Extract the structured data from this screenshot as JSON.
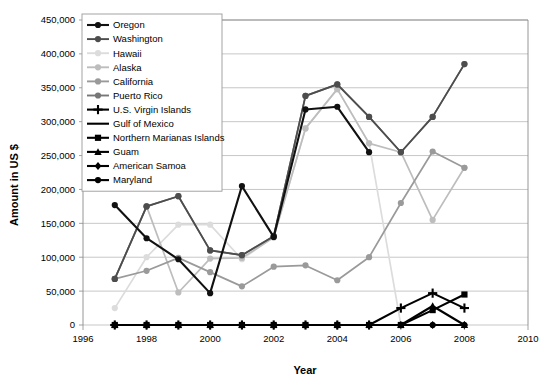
{
  "chart_data": {
    "type": "line",
    "title": "",
    "xlabel": "Year",
    "ylabel": "Amount in US $",
    "xlim": [
      1996,
      2010
    ],
    "ylim": [
      0,
      450000
    ],
    "xticks": [
      "1996",
      "1998",
      "2000",
      "2002",
      "2004",
      "2006",
      "2008",
      "2010"
    ],
    "yticks": [
      "0",
      "50,000",
      "100,000",
      "150,000",
      "200,000",
      "250,000",
      "300,000",
      "350,000",
      "400,000",
      "450,000"
    ],
    "grid": true,
    "legend_position": "top-left",
    "x": [
      1997,
      1998,
      1999,
      2000,
      2001,
      2002,
      2003,
      2004,
      2005,
      2006,
      2007,
      2008
    ],
    "series": [
      {
        "name": "Oregon",
        "color": "#111111",
        "marker": "circle",
        "values": [
          177000,
          128000,
          97000,
          47000,
          205000,
          130000,
          318000,
          322000,
          255000,
          null,
          null,
          null
        ]
      },
      {
        "name": "Washington",
        "color": "#4d4d4d",
        "marker": "circle",
        "values": [
          68000,
          175000,
          190000,
          110000,
          103000,
          131000,
          338000,
          355000,
          307000,
          255000,
          307000,
          385000
        ]
      },
      {
        "name": "Hawaii",
        "color": "#dcdcdc",
        "marker": "circle",
        "values": [
          25000,
          100000,
          148000,
          148000,
          97000,
          130000,
          290000,
          348000,
          268000,
          0,
          null,
          null
        ]
      },
      {
        "name": "Alaska",
        "color": "#bdbdbd",
        "marker": "circle",
        "values": [
          68000,
          175000,
          48000,
          98000,
          99000,
          129000,
          290000,
          348000,
          268000,
          255000,
          155000,
          232000
        ]
      },
      {
        "name": "California",
        "color": "#9a9a9a",
        "marker": "circle",
        "values": [
          68000,
          80000,
          99000,
          78000,
          57000,
          86000,
          88000,
          66000,
          100000,
          180000,
          256000,
          232000
        ]
      },
      {
        "name": "Puerto Rico",
        "color": "#777777",
        "marker": "circle",
        "values": [
          68000,
          175000,
          190000,
          110000,
          103000,
          131000,
          338000,
          355000,
          307000,
          255000,
          307000,
          385000
        ]
      },
      {
        "name": "U.S. Virgin Islands",
        "color": "#000000",
        "marker": "plus",
        "values": [
          0,
          0,
          0,
          0,
          0,
          0,
          0,
          0,
          0,
          25000,
          47000,
          25000
        ]
      },
      {
        "name": "Gulf of Mexico",
        "color": "#000000",
        "marker": "none",
        "values": [
          0,
          0,
          0,
          0,
          0,
          0,
          0,
          0,
          0,
          0,
          0,
          0
        ]
      },
      {
        "name": "Northern Marianas Islands",
        "color": "#000000",
        "marker": "square",
        "values": [
          0,
          0,
          0,
          0,
          0,
          0,
          0,
          0,
          0,
          0,
          22000,
          45000
        ]
      },
      {
        "name": "Guam",
        "color": "#000000",
        "marker": "triangle",
        "values": [
          0,
          0,
          0,
          0,
          0,
          0,
          0,
          0,
          0,
          0,
          28000,
          0
        ]
      },
      {
        "name": "American Samoa",
        "color": "#000000",
        "marker": "diamond",
        "values": [
          0,
          0,
          0,
          0,
          0,
          0,
          0,
          0,
          0,
          0,
          0,
          0
        ]
      },
      {
        "name": "Maryland",
        "color": "#000000",
        "marker": "circle",
        "values": [
          0,
          0,
          0,
          0,
          0,
          0,
          0,
          0,
          0,
          0,
          0,
          0
        ]
      }
    ]
  }
}
